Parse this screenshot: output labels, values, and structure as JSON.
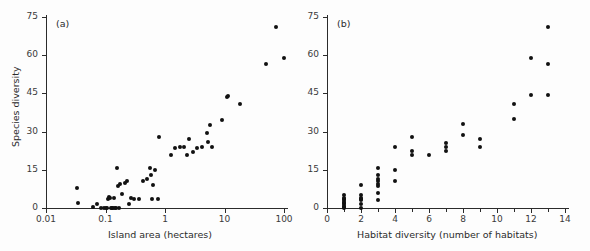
{
  "figure": {
    "background": "#fdfdfd",
    "point_color": "#111111",
    "axis_color": "#2b2b2b"
  },
  "chart_data": [
    {
      "type": "scatter",
      "panel_label": "(a)",
      "title": "",
      "xlabel": "Island area (hectares)",
      "ylabel": "Species diversity",
      "xscale": "log",
      "yscale": "linear",
      "xlim": [
        0.01,
        100
      ],
      "ylim": [
        0,
        75
      ],
      "xticks": [
        0.01,
        0.1,
        1,
        10,
        100
      ],
      "xticklabels": [
        "0.01",
        "0.1",
        "1",
        "10",
        "100"
      ],
      "yticks": [
        0,
        15,
        30,
        45,
        60,
        75
      ],
      "yticklabels": [
        "0",
        "15",
        "30",
        "45",
        "60",
        "75"
      ],
      "grid": false,
      "legend": "none",
      "x": [
        0.033,
        0.034,
        0.062,
        0.072,
        0.085,
        0.095,
        0.1,
        0.105,
        0.11,
        0.115,
        0.12,
        0.125,
        0.13,
        0.135,
        0.14,
        0.145,
        0.15,
        0.155,
        0.16,
        0.17,
        0.175,
        0.19,
        0.21,
        0.23,
        0.25,
        0.27,
        0.3,
        0.36,
        0.42,
        0.5,
        0.55,
        0.58,
        0.6,
        0.62,
        0.68,
        0.75,
        0.8,
        1.25,
        1.45,
        1.8,
        2.1,
        2.3,
        2.5,
        3.0,
        3.4,
        4.2,
        5.0,
        5.3,
        5.6,
        6.2,
        9.0,
        11.0,
        11.5,
        18.0,
        50.0,
        72.0,
        100.0
      ],
      "y": [
        8.0,
        2.0,
        0.5,
        1.5,
        0.0,
        0.0,
        0.0,
        0.0,
        3.5,
        4.5,
        4.0,
        0.0,
        0.0,
        0.0,
        4.0,
        0.0,
        0.0,
        15.8,
        8.5,
        0.0,
        9.5,
        5.5,
        10.0,
        10.5,
        1.5,
        4.0,
        3.5,
        3.5,
        10.5,
        11.5,
        15.8,
        13.0,
        3.5,
        9.0,
        14.8,
        3.5,
        28.0,
        21.0,
        23.5,
        24.0,
        24.0,
        21.0,
        27.0,
        22.0,
        23.5,
        24.0,
        29.5,
        26.0,
        32.5,
        24.0,
        34.5,
        43.5,
        44.0,
        41.0,
        56.5,
        71.0,
        59.0
      ]
    },
    {
      "type": "scatter",
      "panel_label": "(b)",
      "title": "",
      "xlabel": "Habitat diversity (number of habitats)",
      "ylabel": "",
      "xscale": "linear",
      "yscale": "linear",
      "xlim": [
        0,
        14
      ],
      "ylim": [
        0,
        75
      ],
      "xticks": [
        0,
        2,
        4,
        6,
        8,
        10,
        12,
        14
      ],
      "xticklabels": [
        "0",
        "2",
        "4",
        "6",
        "8",
        "10",
        "12",
        "14"
      ],
      "xminorticks": [
        1,
        3,
        5,
        7,
        9,
        11,
        13
      ],
      "yticks": [
        0,
        15,
        30,
        45,
        60,
        75
      ],
      "yticklabels": [
        "0",
        "15",
        "30",
        "45",
        "60",
        "75"
      ],
      "grid": false,
      "legend": "none",
      "x": [
        1,
        1,
        1,
        1,
        1,
        1,
        1,
        1,
        1,
        1,
        2,
        2,
        2,
        2,
        2,
        2,
        2,
        3,
        3,
        3,
        3,
        3,
        3,
        3,
        3,
        4,
        4,
        4,
        5,
        5,
        5,
        6,
        7,
        7,
        7,
        8,
        8,
        9,
        9,
        11,
        11,
        12,
        12,
        13,
        13,
        13
      ],
      "y": [
        0.0,
        0.5,
        1.0,
        1.5,
        2.0,
        2.5,
        3.0,
        3.5,
        4.0,
        5.0,
        0.0,
        1.5,
        3.0,
        3.5,
        4.0,
        5.0,
        9.0,
        3.0,
        6.0,
        8.5,
        9.5,
        10.5,
        11.5,
        13.0,
        15.8,
        10.5,
        15.0,
        24.0,
        21.0,
        22.5,
        28.0,
        21.0,
        22.5,
        24.0,
        25.5,
        28.5,
        33.0,
        24.0,
        27.0,
        35.0,
        41.0,
        44.5,
        59.0,
        44.5,
        56.5,
        71.0
      ]
    }
  ]
}
